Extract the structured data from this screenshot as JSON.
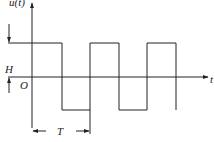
{
  "diagram": {
    "type": "square-wave",
    "labels": {
      "y_axis": "u(t)",
      "x_axis": "t",
      "origin": "O",
      "amplitude": "H",
      "period": "T"
    },
    "colors": {
      "stroke": "#222222",
      "background": "#ffffff"
    },
    "waveform": {
      "levels": [
        "H",
        "-H"
      ],
      "period_label": "T",
      "cycles_shown": 2.5
    }
  }
}
